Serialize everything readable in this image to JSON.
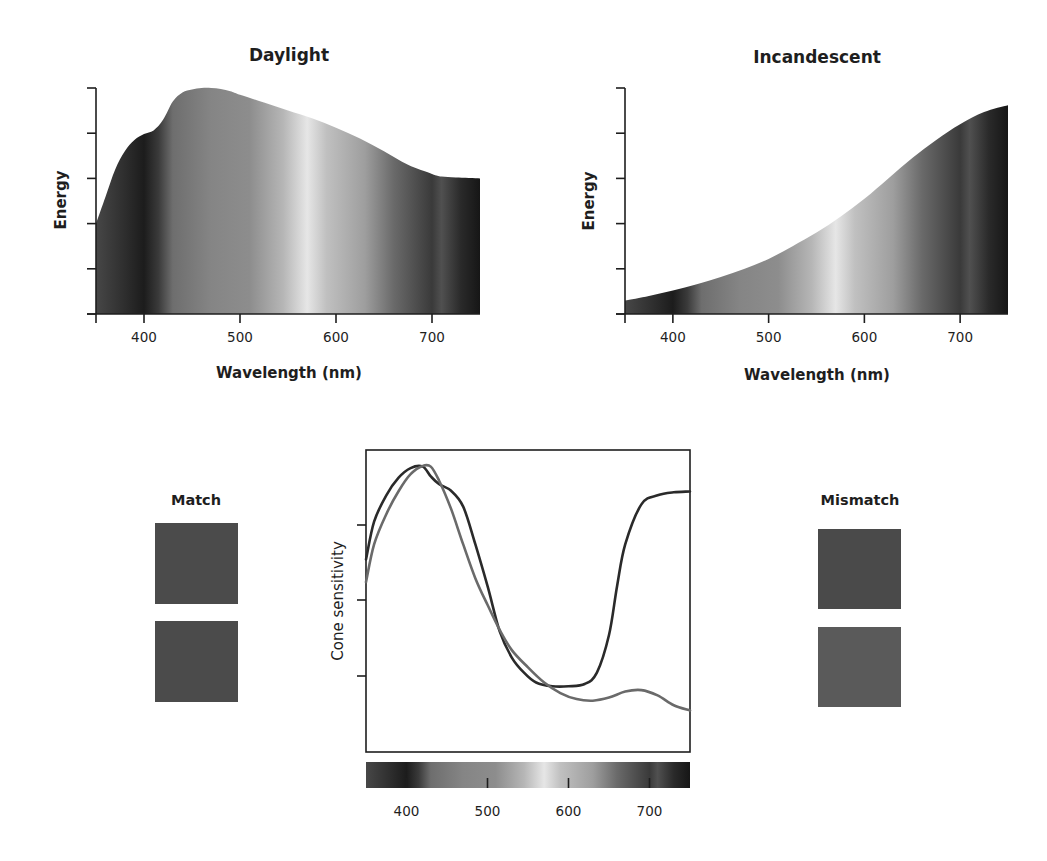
{
  "chart_data": [
    {
      "id": "daylight",
      "type": "area",
      "title": "Daylight",
      "xlabel": "Wavelength (nm)",
      "ylabel": "Energy",
      "xlim": [
        350,
        750
      ],
      "ylim": [
        0,
        5
      ],
      "xticks": [
        400,
        500,
        600,
        700
      ],
      "yticks_count": 6,
      "y_tick_labels": [],
      "fill": "spectrum-gradient (grayscale)",
      "x": [
        350,
        360,
        370,
        380,
        390,
        400,
        410,
        420,
        430,
        440,
        450,
        460,
        470,
        480,
        490,
        500,
        525,
        550,
        575,
        600,
        625,
        650,
        675,
        700,
        710,
        725,
        750
      ],
      "y": [
        2.0,
        2.6,
        3.2,
        3.6,
        3.85,
        3.98,
        4.06,
        4.3,
        4.7,
        4.9,
        4.97,
        5.0,
        5.0,
        4.98,
        4.93,
        4.85,
        4.68,
        4.5,
        4.33,
        4.12,
        3.88,
        3.6,
        3.3,
        3.1,
        3.04,
        3.02,
        3.0
      ]
    },
    {
      "id": "incandescent",
      "type": "area",
      "title": "Incandescent",
      "xlabel": "Wavelength (nm)",
      "ylabel": "Energy",
      "xlim": [
        350,
        750
      ],
      "ylim": [
        0,
        5
      ],
      "xticks": [
        400,
        500,
        600,
        700
      ],
      "yticks_count": 6,
      "y_tick_labels": [],
      "fill": "spectrum-gradient (grayscale)",
      "x": [
        350,
        375,
        400,
        425,
        450,
        475,
        500,
        525,
        550,
        575,
        600,
        625,
        650,
        675,
        700,
        725,
        750
      ],
      "y": [
        0.3,
        0.4,
        0.52,
        0.66,
        0.82,
        1.0,
        1.22,
        1.5,
        1.8,
        2.15,
        2.55,
        3.0,
        3.45,
        3.85,
        4.2,
        4.47,
        4.62
      ]
    },
    {
      "id": "cone-sensitivity",
      "type": "line",
      "title": "",
      "xlabel": "",
      "ylabel": "Cone sensitivity",
      "xlim": [
        350,
        750
      ],
      "ylim": [
        0,
        4
      ],
      "xticks": [
        400,
        500,
        600,
        700
      ],
      "yticks_count": 3,
      "y_tick_labels": [],
      "colorbar": "spectrum-gradient (grayscale)",
      "series": [
        {
          "name": "Dark curve",
          "color": "#2a2a2a",
          "x": [
            350,
            360,
            375,
            390,
            405,
            420,
            430,
            440,
            455,
            470,
            485,
            500,
            515,
            530,
            545,
            560,
            580,
            600,
            620,
            635,
            650,
            660,
            670,
            690,
            710,
            730,
            750
          ],
          "y": [
            2.55,
            3.05,
            3.4,
            3.63,
            3.76,
            3.78,
            3.65,
            3.55,
            3.46,
            3.25,
            2.75,
            2.2,
            1.6,
            1.25,
            1.05,
            0.92,
            0.87,
            0.87,
            0.9,
            1.05,
            1.55,
            2.2,
            2.75,
            3.28,
            3.4,
            3.44,
            3.45
          ]
        },
        {
          "name": "Gray curve",
          "color": "#6a6a6a",
          "x": [
            350,
            360,
            375,
            390,
            405,
            420,
            430,
            440,
            455,
            470,
            485,
            500,
            515,
            530,
            550,
            570,
            590,
            610,
            630,
            650,
            670,
            690,
            710,
            730,
            750
          ],
          "y": [
            2.25,
            2.75,
            3.15,
            3.45,
            3.68,
            3.79,
            3.78,
            3.6,
            3.22,
            2.75,
            2.3,
            1.95,
            1.62,
            1.35,
            1.12,
            0.92,
            0.78,
            0.7,
            0.68,
            0.72,
            0.8,
            0.82,
            0.75,
            0.62,
            0.55
          ]
        }
      ]
    }
  ],
  "spectrum_gradient": {
    "stops": [
      {
        "nm": 350,
        "color": "#474747"
      },
      {
        "nm": 380,
        "color": "#2e2e2e"
      },
      {
        "nm": 400,
        "color": "#1c1c1c"
      },
      {
        "nm": 415,
        "color": "#3a3a3a"
      },
      {
        "nm": 430,
        "color": "#6e6e6e"
      },
      {
        "nm": 470,
        "color": "#858585"
      },
      {
        "nm": 510,
        "color": "#8d8d8d"
      },
      {
        "nm": 545,
        "color": "#b6b6b6"
      },
      {
        "nm": 570,
        "color": "#e6e6e6"
      },
      {
        "nm": 590,
        "color": "#c0c0c0"
      },
      {
        "nm": 630,
        "color": "#9e9e9e"
      },
      {
        "nm": 660,
        "color": "#6a6a6a"
      },
      {
        "nm": 700,
        "color": "#3a3a3a"
      },
      {
        "nm": 710,
        "color": "#505050"
      },
      {
        "nm": 730,
        "color": "#2a2a2a"
      },
      {
        "nm": 750,
        "color": "#161616"
      }
    ]
  },
  "panels": {
    "match": {
      "label": "Match",
      "swatches": [
        {
          "color": "#4b4b4b"
        },
        {
          "color": "#4b4b4b"
        }
      ]
    },
    "mismatch": {
      "label": "Mismatch",
      "swatches": [
        {
          "color": "#4a4a4a"
        },
        {
          "color": "#5a5a5a"
        }
      ]
    }
  }
}
